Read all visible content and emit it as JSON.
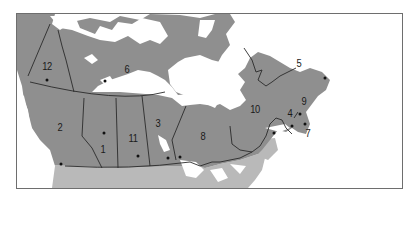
{
  "map": {
    "title": "",
    "colors": {
      "canada_land": "#8f8f8f",
      "usa_land": "#b9b9b9",
      "water": "#ffffff",
      "border": "#2a2a2a",
      "frame": "#6e6e6e"
    },
    "regions": [
      {
        "number": "1",
        "label_x": 103,
        "label_y": 149,
        "capital_x": 104,
        "capital_y": 133
      },
      {
        "number": "2",
        "label_x": 60,
        "label_y": 127,
        "capital_x": 61,
        "capital_y": 164
      },
      {
        "number": "3",
        "label_x": 158,
        "label_y": 123,
        "capital_x": 168,
        "capital_y": 158
      },
      {
        "number": "4",
        "label_x": 290,
        "label_y": 113,
        "capital_x": 292,
        "capital_y": 126
      },
      {
        "number": "5",
        "label_x": 299,
        "label_y": 63,
        "capital_x": 325,
        "capital_y": 78
      },
      {
        "number": "6",
        "label_x": 127,
        "label_y": 69,
        "capital_x": 105,
        "capital_y": 81
      },
      {
        "number": "7",
        "label_x": 308,
        "label_y": 133,
        "capital_x": 305,
        "capital_y": 124
      },
      {
        "number": "8",
        "label_x": 203,
        "label_y": 136,
        "capital_x": 180,
        "capital_y": 157
      },
      {
        "number": "9",
        "label_x": 304,
        "label_y": 101,
        "capital_x": 300,
        "capital_y": 114
      },
      {
        "number": "10",
        "label_x": 255,
        "label_y": 109,
        "capital_x": 274,
        "capital_y": 133
      },
      {
        "number": "11",
        "label_x": 133,
        "label_y": 138,
        "capital_x": 138,
        "capital_y": 156
      },
      {
        "number": "12",
        "label_x": 47,
        "label_y": 66,
        "capital_x": 47,
        "capital_y": 80
      }
    ]
  }
}
